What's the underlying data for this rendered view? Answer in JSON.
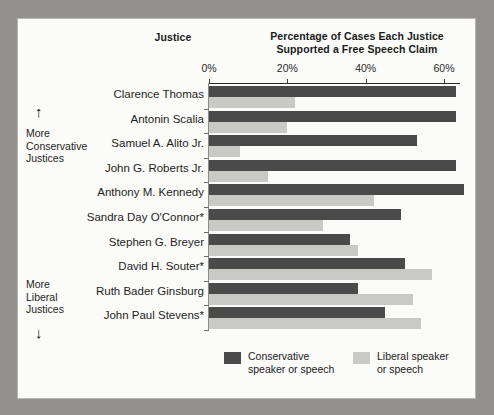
{
  "headers": {
    "justice_column": "Justice",
    "value_column_line1": "Percentage of Cases Each Justice",
    "value_column_line2": "Supported a Free Speech Claim"
  },
  "side_annotations": {
    "top_arrow": "↑",
    "bottom_arrow": "↓",
    "conservative_line1": "More",
    "conservative_line2": "Conservative",
    "conservative_line3": "Justices",
    "liberal_line1": "More",
    "liberal_line2": "Liberal",
    "liberal_line3": "Justices"
  },
  "legend": {
    "conservative_line1": "Conservative",
    "conservative_line2": "speaker or speech",
    "liberal_line1": "Liberal speaker",
    "liberal_line2": "or speech",
    "conservative_color": "#4a4a4a",
    "liberal_color": "#c9c9c6"
  },
  "chart_data": {
    "type": "bar",
    "orientation": "horizontal",
    "title": "Percentage of Cases Each Justice Supported a Free Speech Claim",
    "xlabel": "",
    "ylabel": "Justice",
    "xlim": [
      0,
      64
    ],
    "grid": false,
    "legend_position": "bottom",
    "tick_labels": [
      "0%",
      "20%",
      "40%",
      "60%"
    ],
    "tick_values": [
      0,
      20,
      40,
      60
    ],
    "categories": [
      "Clarence Thomas",
      "Antonin Scalia",
      "Samuel A. Alito Jr.",
      "John G. Roberts Jr.",
      "Anthony M. Kennedy",
      "Sandra Day O'Connor*",
      "Stephen G. Breyer",
      "David H. Souter*",
      "Ruth Bader Ginsburg",
      "John Paul Stevens*"
    ],
    "series": [
      {
        "name": "Conservative speaker or speech",
        "color": "#4a4a4a",
        "values": [
          63,
          63,
          53,
          63,
          65,
          49,
          36,
          50,
          38,
          45
        ]
      },
      {
        "name": "Liberal speaker or speech",
        "color": "#c9c9c6",
        "values": [
          22,
          20,
          8,
          15,
          42,
          29,
          38,
          57,
          52,
          54
        ]
      }
    ]
  }
}
